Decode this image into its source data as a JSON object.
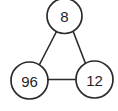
{
  "diagram": {
    "type": "node-link-triangle",
    "background_color": "#ffffff",
    "stroke_color": "#2b2b2b",
    "text_color": "#1f1f1f",
    "nodes": [
      {
        "id": "top",
        "label": "8",
        "cx": 64.5,
        "cy": 16.0,
        "r": 17.5
      },
      {
        "id": "bottom-left",
        "label": "96",
        "cx": 29.5,
        "cy": 80.5,
        "r": 18.5
      },
      {
        "id": "bottom-right",
        "label": "12",
        "cx": 94.5,
        "cy": 79.5,
        "r": 18.5
      }
    ],
    "edges": [
      {
        "id": "top-to-bottom-left",
        "from": "top",
        "to": "bottom-left",
        "x1": 56.5,
        "y1": 31.5,
        "x2": 39.5,
        "y2": 64.5
      },
      {
        "id": "top-to-bottom-right",
        "from": "top",
        "to": "bottom-right",
        "x1": 73.0,
        "y1": 31.0,
        "x2": 85.5,
        "y2": 63.5
      },
      {
        "id": "bottom-left-to-bottom-right",
        "from": "bottom-left",
        "to": "bottom-right",
        "x1": 48.0,
        "y1": 79.5,
        "x2": 76.0,
        "y2": 79.5
      }
    ]
  }
}
